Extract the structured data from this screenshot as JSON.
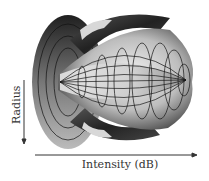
{
  "figure": {
    "y_axis": {
      "label": "Radius",
      "direction": "down"
    },
    "x_axis": {
      "label": "Intensity (dB)",
      "direction": "right"
    },
    "colors": {
      "surface_light": "#e8e8e8",
      "surface_mid": "#9a9a9a",
      "surface_dark": "#2a2a2a",
      "mesh": "#1a1a1a",
      "axis": "#333333"
    }
  }
}
